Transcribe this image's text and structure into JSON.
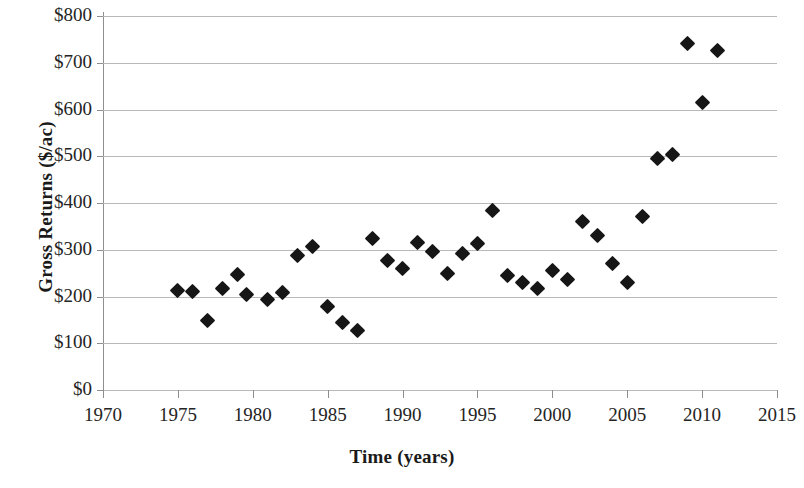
{
  "chart_data": {
    "type": "scatter",
    "title": "",
    "xlabel": "Time (years)",
    "ylabel": "Gross Returns ($/ac)",
    "xlim": [
      1970,
      2015
    ],
    "ylim": [
      0,
      800
    ],
    "xticks": [
      1970,
      1975,
      1980,
      1985,
      1990,
      1995,
      2000,
      2005,
      2010,
      2015
    ],
    "xtick_labels": [
      "1970",
      "1975",
      "1980",
      "1985",
      "1990",
      "1995",
      "2000",
      "2005",
      "2010",
      "2015"
    ],
    "yticks": [
      0,
      100,
      200,
      300,
      400,
      500,
      600,
      700,
      800
    ],
    "ytick_labels": [
      "$0",
      "$100",
      "$200",
      "$300",
      "$400",
      "$500",
      "$600",
      "$700",
      "$800"
    ],
    "grid": "horizontal",
    "legend": "none",
    "marker_shape": "diamond",
    "marker_color": "#161616",
    "grid_color": "#b9b9b9",
    "axis_color": "#8e8e8e",
    "points": [
      {
        "x": 1975,
        "y": 212
      },
      {
        "x": 1976,
        "y": 211
      },
      {
        "x": 1977,
        "y": 149
      },
      {
        "x": 1978,
        "y": 218
      },
      {
        "x": 1979,
        "y": 248
      },
      {
        "x": 1979.6,
        "y": 205
      },
      {
        "x": 1981,
        "y": 193
      },
      {
        "x": 1982,
        "y": 209
      },
      {
        "x": 1983,
        "y": 288
      },
      {
        "x": 1984,
        "y": 307
      },
      {
        "x": 1985,
        "y": 178
      },
      {
        "x": 1986,
        "y": 144
      },
      {
        "x": 1987,
        "y": 127
      },
      {
        "x": 1988,
        "y": 325
      },
      {
        "x": 1989,
        "y": 278
      },
      {
        "x": 1990,
        "y": 259
      },
      {
        "x": 1991,
        "y": 315
      },
      {
        "x": 1992,
        "y": 296
      },
      {
        "x": 1993,
        "y": 250
      },
      {
        "x": 1994,
        "y": 291
      },
      {
        "x": 1995,
        "y": 313
      },
      {
        "x": 1996,
        "y": 384
      },
      {
        "x": 1997,
        "y": 245
      },
      {
        "x": 1998,
        "y": 229
      },
      {
        "x": 1999,
        "y": 218
      },
      {
        "x": 2000,
        "y": 255
      },
      {
        "x": 2001,
        "y": 236
      },
      {
        "x": 2002,
        "y": 360
      },
      {
        "x": 2003,
        "y": 330
      },
      {
        "x": 2004,
        "y": 271
      },
      {
        "x": 2005,
        "y": 230
      },
      {
        "x": 2006,
        "y": 371
      },
      {
        "x": 2007,
        "y": 495
      },
      {
        "x": 2008,
        "y": 503
      },
      {
        "x": 2009,
        "y": 742
      },
      {
        "x": 2010,
        "y": 615
      },
      {
        "x": 2011,
        "y": 727
      }
    ]
  },
  "axes": {
    "x_title": "Time (years)",
    "y_title": "Gross Returns ($/ac)"
  }
}
